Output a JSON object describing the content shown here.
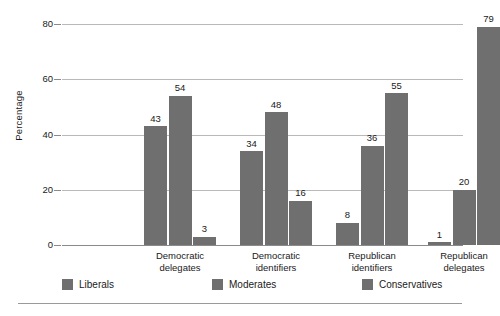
{
  "chart_data": {
    "type": "bar",
    "title": "",
    "subtitle": "",
    "xlabel": "",
    "ylabel": "Percentage",
    "ylim": [
      0,
      80
    ],
    "yticks": [
      0,
      20,
      40,
      60,
      80
    ],
    "ytick_labels": [
      "0",
      "20",
      "40",
      "60",
      "80"
    ],
    "grid": true,
    "legend_position": "bottom",
    "categories": [
      "Democratic delegates",
      "Democratic identifiers",
      "Republican identifiers",
      "Republican delegates"
    ],
    "category_lines": [
      [
        "Democratic",
        "delegates"
      ],
      [
        "Democratic",
        "identifiers"
      ],
      [
        "Republican",
        "identifiers"
      ],
      [
        "Republican",
        "delegates"
      ]
    ],
    "series": [
      {
        "name": "Liberals",
        "values": [
          43,
          34,
          8,
          1
        ],
        "color": "#6f6f6f"
      },
      {
        "name": "Moderates",
        "values": [
          54,
          48,
          36,
          20
        ],
        "color": "#6f6f6f"
      },
      {
        "name": "Conservatives",
        "values": [
          3,
          16,
          55,
          79
        ],
        "color": "#6f6f6f"
      }
    ],
    "value_labels": [
      [
        "43",
        "54",
        "3"
      ],
      [
        "34",
        "48",
        "16"
      ],
      [
        "8",
        "36",
        "55"
      ],
      [
        "1",
        "20",
        "79"
      ]
    ],
    "bar_color": "#6f6f6f",
    "gridline_color": "#b9b9b9",
    "axis_color": "#8a8a8a",
    "background": "#ffffff"
  },
  "legend": {
    "items": [
      {
        "label": "Liberals",
        "swatch_color": "#6f6f6f"
      },
      {
        "label": "Moderates",
        "swatch_color": "#6f6f6f"
      },
      {
        "label": "Conservatives",
        "swatch_color": "#6f6f6f"
      }
    ]
  }
}
